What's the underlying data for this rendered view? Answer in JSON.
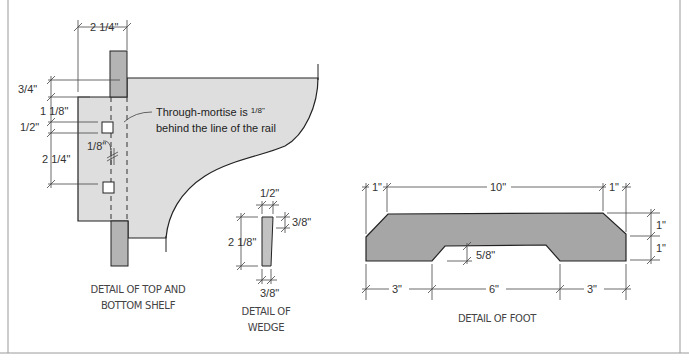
{
  "colors": {
    "panel_fill": "#dedede",
    "rail_fill": "#b4b4b4",
    "foot_fill": "#a6a6a6",
    "wedge_fill": "#c2c2c2",
    "outline": "#222222",
    "frame": "#9a9a9a"
  },
  "shelf_detail": {
    "caption_line1": "DETAIL OF TOP AND",
    "caption_line2": "BOTTOM SHELF",
    "note_line1": "Through-mortise is",
    "note_frac": "1/8\"",
    "note_line2": "behind the line of the rail",
    "dims": {
      "width_top": "2 1/4\"",
      "rail_overhang": "3/4\"",
      "to_mortise": "1 1/8\"",
      "mortise": "1/2\"",
      "mortise_spacing": "2 1/4\"",
      "offset": "1/8\""
    }
  },
  "wedge_detail": {
    "caption_line1": "DETAIL OF",
    "caption_line2": "WEDGE",
    "dims": {
      "top_width": "1/2\"",
      "bottom_width": "3/8\"",
      "height": "2 1/8\"",
      "side": "3/8\""
    }
  },
  "foot_detail": {
    "caption": "DETAIL OF FOOT",
    "dims": {
      "left_chamfer": "1\"",
      "top_length": "10\"",
      "right_chamfer": "1\"",
      "upper_height": "1\"",
      "lower_height": "1\"",
      "cutout_depth": "5/8\"",
      "left_leg": "3\"",
      "cutout_length": "6\"",
      "right_leg": "3\""
    }
  }
}
